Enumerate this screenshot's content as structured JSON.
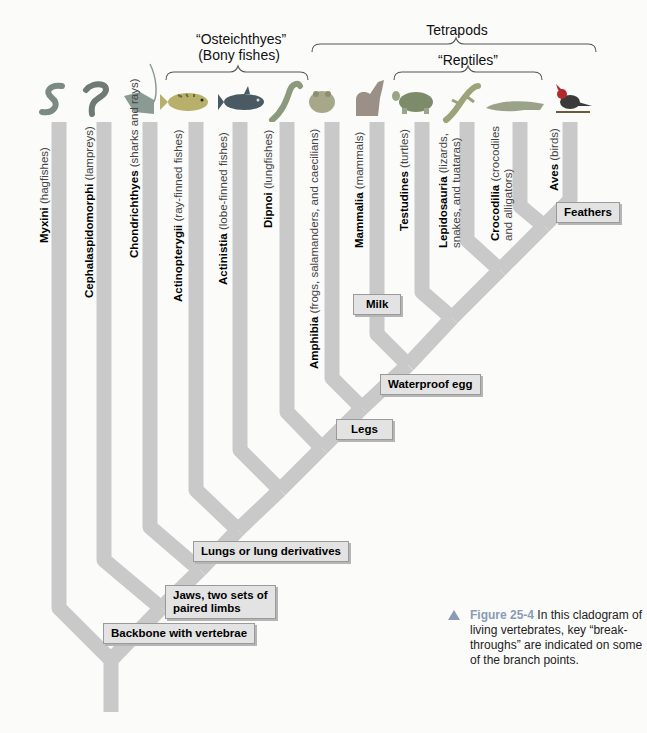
{
  "groups": {
    "osteichthyes": {
      "line1": "“Osteichthyes”",
      "line2": "(Bony fishes)"
    },
    "tetrapods": {
      "label": "Tetrapods"
    },
    "reptiles": {
      "label": "“Reptiles”"
    }
  },
  "taxa": [
    {
      "name": "Myxini",
      "common": "(hagfishes)",
      "animal": "hagfish-icon"
    },
    {
      "name": "Cephalaspidomorphi",
      "common": "(lampreys)",
      "animal": "lamprey-icon"
    },
    {
      "name": "Chondrichthyes",
      "common": "(sharks and rays)",
      "animal": "ray-icon"
    },
    {
      "name": "Actinopterygii",
      "common": "(ray-finned fishes)",
      "animal": "perch-icon"
    },
    {
      "name": "Actinistia",
      "common": "(lobe-finned fishes)",
      "animal": "coelacanth-icon"
    },
    {
      "name": "Dipnoi",
      "common": "(lungfishes)",
      "animal": "lungfish-icon"
    },
    {
      "name": "Amphibia",
      "common": "(frogs, salamanders, and caecilians)",
      "animal": "frog-icon"
    },
    {
      "name": "Mammalia",
      "common": "(mammals)",
      "animal": "wolf-icon"
    },
    {
      "name": "Testudines",
      "common": "(turtles)",
      "animal": "turtle-icon"
    },
    {
      "name": "Lepidosauria",
      "common": "(lizards,",
      "common2": "snakes, and tuataras)",
      "animal": "lizard-icon"
    },
    {
      "name": "Crocodilia",
      "common": "(crocodiles",
      "common2": "and alligators)",
      "animal": "crocodile-icon"
    },
    {
      "name": "Aves",
      "common": "(birds)",
      "animal": "cardinal-bird-icon"
    }
  ],
  "traits": {
    "backbone": "Backbone with vertebrae",
    "jaws_line1": "Jaws, two sets of",
    "jaws_line2": "paired limbs",
    "lungs": "Lungs or lung derivatives",
    "legs": "Legs",
    "waterproof_egg": "Waterproof egg",
    "milk": "Milk",
    "feathers": "Feathers"
  },
  "caption": {
    "figure": "Figure 25-4",
    "text": " In this cladogram of living vertebrates, key “break-throughs” are indicated on some of the branch points."
  },
  "colors": {
    "branch": "#c9c9c9",
    "trait_box": "#e3e3e3",
    "caption_accent": "#8a9bb5"
  }
}
